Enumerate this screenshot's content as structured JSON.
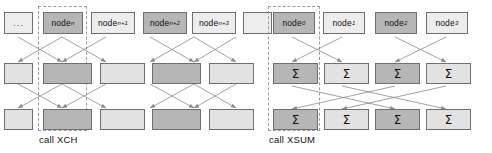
{
  "figure": {
    "title": "",
    "panels": [
      {
        "id": "xch",
        "caption": "call XCH",
        "highlight_column_label": "node_n",
        "rows": [
          {
            "role": "node-row",
            "cells": [
              {
                "label": "...",
                "tone": "pale",
                "kind": "ellipsis"
              },
              {
                "label": "node",
                "sub": "n",
                "tone": "dark",
                "kind": "node"
              },
              {
                "label": "node",
                "sub": "n+1",
                "tone": "pale",
                "kind": "node"
              },
              {
                "label": "node",
                "sub": "n+2",
                "tone": "dark",
                "kind": "node"
              },
              {
                "label": "node",
                "sub": "n+3",
                "tone": "pale",
                "kind": "node"
              },
              {
                "label": "",
                "tone": "pale",
                "kind": "blank"
              }
            ]
          },
          {
            "role": "stage-1-row",
            "cells": [
              {
                "label": "",
                "tone": "light",
                "kind": "blank"
              },
              {
                "label": "",
                "tone": "dark",
                "kind": "blank"
              },
              {
                "label": "",
                "tone": "light",
                "kind": "blank"
              },
              {
                "label": "",
                "tone": "dark",
                "kind": "blank"
              },
              {
                "label": "",
                "tone": "light",
                "kind": "blank"
              },
              {
                "label": "",
                "tone": "light",
                "kind": "blank"
              }
            ]
          },
          {
            "role": "stage-2-row",
            "cells": [
              {
                "label": "",
                "tone": "light",
                "kind": "blank"
              },
              {
                "label": "",
                "tone": "dark",
                "kind": "blank"
              },
              {
                "label": "",
                "tone": "light",
                "kind": "blank"
              },
              {
                "label": "",
                "tone": "dark",
                "kind": "blank"
              },
              {
                "label": "",
                "tone": "light",
                "kind": "blank"
              },
              {
                "label": "",
                "tone": "light",
                "kind": "blank"
              }
            ]
          }
        ]
      },
      {
        "id": "xsum",
        "caption": "call XSUM",
        "highlight_column_label": "node_0",
        "rows": [
          {
            "role": "node-row",
            "cells": [
              {
                "label": "node",
                "sub": "0",
                "tone": "dark",
                "kind": "node"
              },
              {
                "label": "node",
                "sub": "1",
                "tone": "pale",
                "kind": "node"
              },
              {
                "label": "node",
                "sub": "2",
                "tone": "dark",
                "kind": "node"
              },
              {
                "label": "node",
                "sub": "3",
                "tone": "pale",
                "kind": "node"
              }
            ]
          },
          {
            "role": "stage-1-row",
            "cells": [
              {
                "label": "Σ",
                "tone": "dark",
                "kind": "sigma"
              },
              {
                "label": "Σ",
                "tone": "light",
                "kind": "sigma"
              },
              {
                "label": "Σ",
                "tone": "dark",
                "kind": "sigma"
              },
              {
                "label": "Σ",
                "tone": "light",
                "kind": "sigma"
              }
            ]
          },
          {
            "role": "stage-2-row",
            "cells": [
              {
                "label": "Σ",
                "tone": "dark",
                "kind": "sigma"
              },
              {
                "label": "Σ",
                "tone": "light",
                "kind": "sigma"
              },
              {
                "label": "Σ",
                "tone": "dark",
                "kind": "sigma"
              },
              {
                "label": "Σ",
                "tone": "light",
                "kind": "sigma"
              }
            ]
          }
        ]
      }
    ],
    "colors": {
      "box_dark": "#b6b6b6",
      "box_light": "#e2e2e2",
      "box_pale": "#ededed",
      "box_border": "#6f6f6f",
      "arrow": "#8a8a8a",
      "dashed_guide": "#9a9a9a",
      "background": "#ffffff",
      "text": "#111111"
    }
  }
}
